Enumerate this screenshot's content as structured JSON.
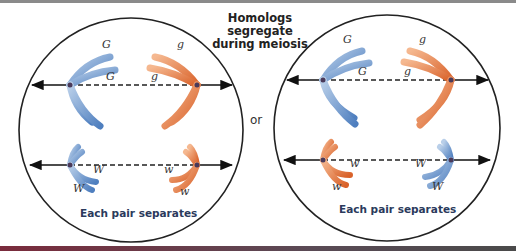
{
  "title": {
    "line1": "Homologs segregate",
    "line2": "during meiosis"
  },
  "connector": "or",
  "colors": {
    "blue_chromosome": "#6b93c9",
    "orange_chromosome": "#e07a45",
    "caption_text": "#2b3a5c",
    "top_bar": "#8a8a8a",
    "bottom_bar": "#7a2b3c"
  },
  "cells": [
    {
      "caption": "Each pair separates",
      "upper_pair": {
        "left_allele_top": "G",
        "left_allele_bottom": "G",
        "right_allele_top": "g",
        "right_allele_bottom": "g"
      },
      "lower_pair": {
        "left_allele_top": "W",
        "left_allele_bottom": "W",
        "right_allele_top": "w",
        "right_allele_bottom": "w"
      }
    },
    {
      "caption": "Each pair separates",
      "upper_pair": {
        "left_allele_top": "G",
        "left_allele_bottom": "G",
        "right_allele_top": "g",
        "right_allele_bottom": "g"
      },
      "lower_pair": {
        "left_allele_top": "w",
        "left_allele_bottom": "w",
        "right_allele_top": "W",
        "right_allele_bottom": "W"
      }
    }
  ]
}
